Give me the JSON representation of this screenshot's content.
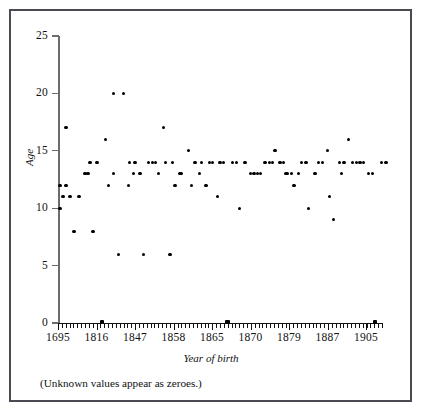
{
  "chart_data": {
    "type": "scatter",
    "title": "",
    "xlabel": "Year of birth",
    "ylabel": "Age",
    "note": "(Unknown values appear as zeroes.)",
    "grid": false,
    "legend": null,
    "ylim": [
      0,
      25
    ],
    "yticks": [
      0,
      5,
      10,
      15,
      20,
      25
    ],
    "ytick_labels": [
      "0",
      "5",
      "10",
      "15",
      "20",
      "25"
    ],
    "xtick_labels": [
      "1695",
      "1816",
      "1847",
      "1858",
      "1865",
      "1870",
      "1879",
      "1887",
      "1905"
    ],
    "xtick_positions": [
      58,
      96.5,
      135,
      173.5,
      212,
      250.5,
      289,
      327.5,
      366
    ],
    "x_minor_tick_count": 84,
    "x_axis_note": "Categorical year-of-birth positions; minor ticks between labelled years",
    "points": [
      {
        "x": 60,
        "y": 10
      },
      {
        "x": 60,
        "y": 12
      },
      {
        "x": 63,
        "y": 11
      },
      {
        "x": 66,
        "y": 12
      },
      {
        "x": 66,
        "y": 17
      },
      {
        "x": 70,
        "y": 11
      },
      {
        "x": 74,
        "y": 8
      },
      {
        "x": 79,
        "y": 11
      },
      {
        "x": 85,
        "y": 13
      },
      {
        "x": 88,
        "y": 13
      },
      {
        "x": 90,
        "y": 14
      },
      {
        "x": 97,
        "y": 14
      },
      {
        "x": 93,
        "y": 8
      },
      {
        "x": 101.7,
        "y": 0
      },
      {
        "x": 105.7,
        "y": 16
      },
      {
        "x": 108.3,
        "y": 12
      },
      {
        "x": 113.3,
        "y": 13
      },
      {
        "x": 113.3,
        "y": 20
      },
      {
        "x": 118.3,
        "y": 6
      },
      {
        "x": 123.3,
        "y": 20
      },
      {
        "x": 128.3,
        "y": 12
      },
      {
        "x": 129.3,
        "y": 14
      },
      {
        "x": 135,
        "y": 14
      },
      {
        "x": 133.3,
        "y": 13
      },
      {
        "x": 140,
        "y": 13
      },
      {
        "x": 143.3,
        "y": 6
      },
      {
        "x": 148.3,
        "y": 14
      },
      {
        "x": 152.3,
        "y": 14
      },
      {
        "x": 155.3,
        "y": 14
      },
      {
        "x": 158.3,
        "y": 13
      },
      {
        "x": 163.3,
        "y": 17
      },
      {
        "x": 165.7,
        "y": 14
      },
      {
        "x": 172.3,
        "y": 14
      },
      {
        "x": 170,
        "y": 6
      },
      {
        "x": 175,
        "y": 12
      },
      {
        "x": 181.7,
        "y": 13
      },
      {
        "x": 180,
        "y": 13
      },
      {
        "x": 188.3,
        "y": 15
      },
      {
        "x": 191.7,
        "y": 12
      },
      {
        "x": 195,
        "y": 14
      },
      {
        "x": 201.7,
        "y": 14
      },
      {
        "x": 199.3,
        "y": 13
      },
      {
        "x": 206,
        "y": 12
      },
      {
        "x": 209.3,
        "y": 14
      },
      {
        "x": 212.7,
        "y": 14
      },
      {
        "x": 217.3,
        "y": 11
      },
      {
        "x": 220,
        "y": 14
      },
      {
        "x": 223.3,
        "y": 14
      },
      {
        "x": 227.5,
        "y": 0
      },
      {
        "x": 232.7,
        "y": 14
      },
      {
        "x": 236.7,
        "y": 14
      },
      {
        "x": 239.3,
        "y": 10
      },
      {
        "x": 245,
        "y": 14
      },
      {
        "x": 250.7,
        "y": 13
      },
      {
        "x": 254,
        "y": 13
      },
      {
        "x": 257.3,
        "y": 13
      },
      {
        "x": 260.7,
        "y": 13
      },
      {
        "x": 265,
        "y": 14
      },
      {
        "x": 269.3,
        "y": 14
      },
      {
        "x": 272.7,
        "y": 14
      },
      {
        "x": 275,
        "y": 15
      },
      {
        "x": 280,
        "y": 14
      },
      {
        "x": 283.3,
        "y": 14
      },
      {
        "x": 286,
        "y": 13
      },
      {
        "x": 287.3,
        "y": 13
      },
      {
        "x": 291.7,
        "y": 13
      },
      {
        "x": 294,
        "y": 12
      },
      {
        "x": 298.3,
        "y": 13
      },
      {
        "x": 301.7,
        "y": 14
      },
      {
        "x": 306,
        "y": 14
      },
      {
        "x": 308.3,
        "y": 10
      },
      {
        "x": 315,
        "y": 13
      },
      {
        "x": 318.3,
        "y": 14
      },
      {
        "x": 322.7,
        "y": 14
      },
      {
        "x": 327.3,
        "y": 15
      },
      {
        "x": 329.3,
        "y": 11
      },
      {
        "x": 333.3,
        "y": 9
      },
      {
        "x": 339.3,
        "y": 14
      },
      {
        "x": 344,
        "y": 14
      },
      {
        "x": 341.7,
        "y": 13
      },
      {
        "x": 348.3,
        "y": 16
      },
      {
        "x": 352.7,
        "y": 14
      },
      {
        "x": 356.7,
        "y": 14
      },
      {
        "x": 360,
        "y": 14
      },
      {
        "x": 363.3,
        "y": 14
      },
      {
        "x": 368.3,
        "y": 13
      },
      {
        "x": 372.7,
        "y": 13
      },
      {
        "x": 375,
        "y": 0
      },
      {
        "x": 381.7,
        "y": 14
      },
      {
        "x": 386,
        "y": 14
      }
    ]
  },
  "colors": {
    "point": "#000000",
    "axis": "#111111",
    "frame": "#4a4a52",
    "background": "#ffffff"
  }
}
